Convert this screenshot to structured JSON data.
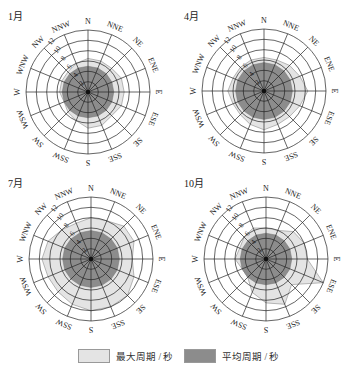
{
  "chart_data": {
    "type": "radar",
    "directions": [
      "N",
      "NNE",
      "NE",
      "ENE",
      "E",
      "ESE",
      "SE",
      "SSE",
      "S",
      "SSW",
      "SW",
      "WSW",
      "W",
      "WNW",
      "NW",
      "NNW"
    ],
    "radial_ticks": [
      2,
      4,
      6,
      8,
      10,
      12
    ],
    "radial_max": 12,
    "series_names": [
      "最大周期 / 秒",
      "平均周期 / 秒"
    ],
    "panels": [
      {
        "title": "1月",
        "max_period": [
          6.5,
          6.5,
          6.5,
          7,
          7,
          7,
          6.5,
          7,
          7,
          6,
          5.5,
          5,
          5.5,
          5.5,
          5.5,
          6
        ],
        "mean_period": [
          5,
          5,
          5,
          5,
          5,
          5,
          5,
          5,
          5,
          5,
          5,
          5,
          5,
          5,
          5,
          5
        ]
      },
      {
        "title": "4月",
        "max_period": [
          6.5,
          6.5,
          7,
          7.5,
          8.5,
          7.5,
          7,
          7,
          7.5,
          7,
          6.5,
          6.5,
          7,
          6.5,
          6.5,
          6.5
        ],
        "mean_period": [
          5.5,
          5.5,
          5.5,
          5.5,
          5.5,
          5.5,
          5.5,
          5.5,
          5.5,
          5.5,
          5.5,
          5.5,
          5.5,
          5.5,
          5.5,
          5.5
        ]
      },
      {
        "title": "7月",
        "max_period": [
          8,
          8,
          9,
          9,
          8,
          9,
          10,
          10,
          10,
          9.5,
          9,
          9,
          9.5,
          9,
          8,
          7.5
        ],
        "mean_period": [
          5.5,
          5.5,
          5.5,
          5.5,
          5.5,
          5.5,
          5.5,
          5.5,
          5.5,
          5.5,
          5.5,
          5.5,
          5.5,
          5.5,
          5.5,
          5.5
        ]
      },
      {
        "title": "10月",
        "max_period": [
          6,
          6,
          7.5,
          8,
          8,
          12,
          7,
          9.5,
          8.5,
          7,
          5,
          5,
          6,
          5.5,
          6,
          6.5
        ],
        "mean_period": [
          5,
          5,
          5,
          5,
          5,
          5,
          5,
          5,
          5,
          5,
          5,
          5,
          5,
          5,
          5,
          5
        ]
      }
    ],
    "colors": {
      "max_fill": "#e4e4e4",
      "mean_fill": "#8c8c8c",
      "grid": "#222222"
    }
  },
  "legend": {
    "max_label": "最大周期 / 秒",
    "mean_label": "平均周期 / 秒"
  }
}
